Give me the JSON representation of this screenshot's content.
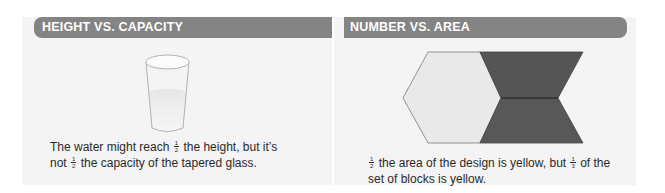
{
  "panels": [
    {
      "title": "HEIGHT VS. CAPACITY",
      "illustration": "tapered-glass-with-water",
      "caption": {
        "part1": "The water might reach",
        "frac1": {
          "num": "1",
          "den": "2"
        },
        "part2": "the height, but it’s not",
        "frac2": {
          "num": "1",
          "den": "2"
        },
        "part3": "the capacity of the tapered glass."
      }
    },
    {
      "title": "NUMBER VS. AREA",
      "illustration": "hexagon-and-two-trapezoids",
      "caption": {
        "frac1": {
          "num": "1",
          "den": "2"
        },
        "part1": "the area of the design is yellow, but",
        "frac2": {
          "num": "1",
          "den": "3"
        },
        "part2": "of the set of blocks is yellow."
      }
    }
  ],
  "colors": {
    "header": "#848484",
    "panel_bg": "#f4f4f4",
    "hexagon_fill": "#e9e9e9",
    "trapezoid_fill": "#555555",
    "text": "#2a2a2a"
  }
}
